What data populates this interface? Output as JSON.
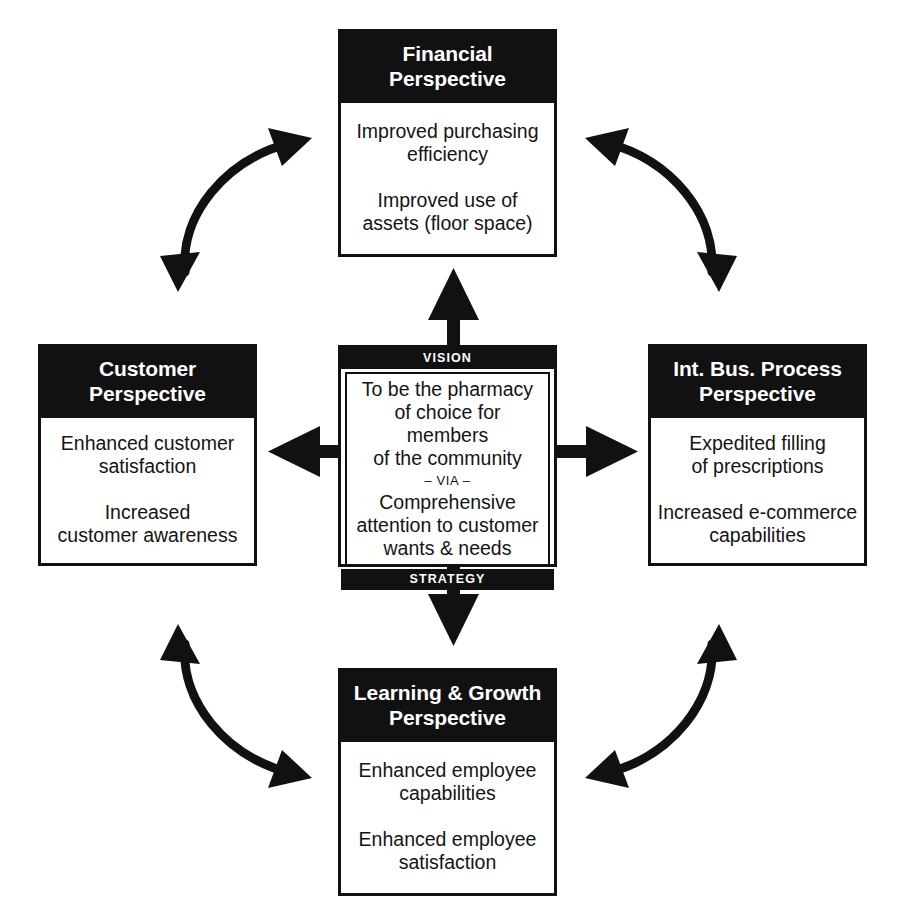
{
  "diagram": {
    "ink_color": "#111111",
    "paper_color": "#ffffff"
  },
  "center": {
    "top_band_label": "VISION",
    "bottom_band_label": "STRATEGY",
    "vision_text": "To be the pharmacy\nof choice for members\nof the community",
    "separator_label": "– VIA –",
    "strategy_text": "Comprehensive\nattention to customer\nwants & needs"
  },
  "perspectives": {
    "financial": {
      "title": "Financial\nPerspective",
      "items": [
        "Improved purchasing\nefficiency",
        "Improved use of\nassets (floor space)"
      ]
    },
    "customer": {
      "title": "Customer\nPerspective",
      "items": [
        "Enhanced customer\nsatisfaction",
        "Increased\ncustomer awareness"
      ]
    },
    "internal_business_process": {
      "title": "Int. Bus. Process\nPerspective",
      "items": [
        "Expedited filling\nof prescriptions",
        "Increased e-commerce\ncapabilities"
      ]
    },
    "learning_growth": {
      "title": "Learning & Growth\nPerspective",
      "items": [
        "Enhanced employee\ncapabilities",
        "Enhanced employee\nsatisfaction"
      ]
    }
  },
  "connectors": {
    "center_to_financial": "up-arrow",
    "center_to_customer": "left-arrow",
    "center_to_internal_business_process": "right-arrow",
    "center_to_learning_growth": "down-arrow",
    "customer_to_financial": "curved-double-arrow",
    "financial_to_internal_business_process": "curved-double-arrow",
    "internal_business_process_to_learning_growth": "curved-double-arrow",
    "learning_growth_to_customer": "curved-double-arrow"
  }
}
